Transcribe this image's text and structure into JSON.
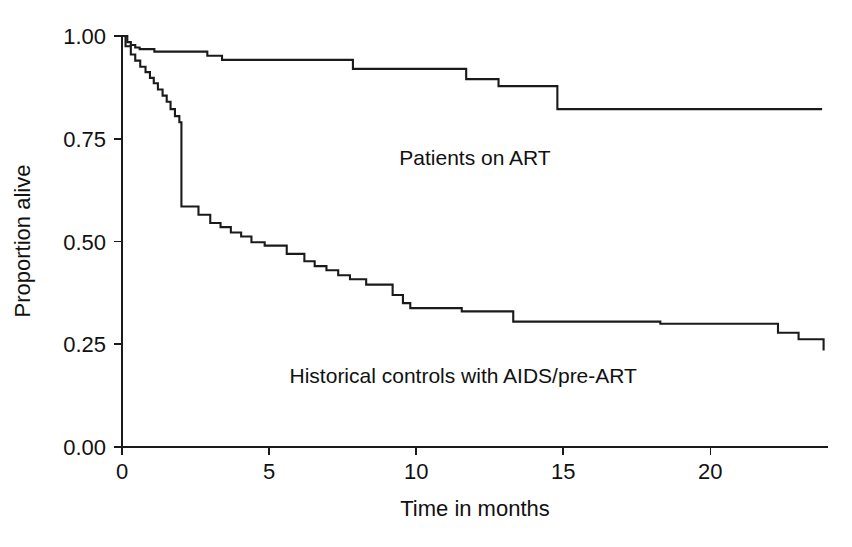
{
  "chart_data": {
    "type": "line",
    "subtype": "kaplan-meier-survival",
    "title": "",
    "xlabel": "Time in months",
    "ylabel": "Proportion alive",
    "xlim": [
      0,
      24
    ],
    "ylim": [
      0,
      1.0
    ],
    "xticks": [
      0,
      5,
      10,
      15,
      20
    ],
    "xtick_labels": [
      "0",
      "5",
      "10",
      "15",
      "20"
    ],
    "yticks": [
      0.0,
      0.25,
      0.5,
      0.75,
      1.0
    ],
    "ytick_labels": [
      "0.00",
      "0.25",
      "0.50",
      "0.75",
      "1.00"
    ],
    "grid": false,
    "legend_position": "inline-annotations",
    "line_color": "#1a1a1a",
    "background_color": "#ffffff",
    "series": [
      {
        "name": "Patients on ART",
        "label": "Patients on ART",
        "label_x": 12.0,
        "label_y": 0.685,
        "step": "post",
        "x": [
          0.0,
          0.18,
          0.3,
          0.45,
          0.6,
          1.1,
          2.9,
          3.4,
          7.85,
          11.7,
          12.8,
          14.8,
          23.8
        ],
        "y": [
          1.0,
          0.985,
          0.978,
          0.972,
          0.968,
          0.962,
          0.952,
          0.942,
          0.92,
          0.895,
          0.878,
          0.822,
          0.822
        ]
      },
      {
        "name": "Historical controls with AIDS/pre-ART",
        "label": "Historical controls with AIDS/pre-ART",
        "label_x": 11.6,
        "label_y": 0.155,
        "step": "post",
        "x": [
          0.0,
          0.12,
          0.3,
          0.45,
          0.62,
          0.8,
          0.95,
          1.08,
          1.22,
          1.38,
          1.52,
          1.65,
          1.8,
          1.95,
          2.02,
          2.6,
          3.0,
          3.35,
          3.7,
          4.05,
          4.4,
          4.85,
          5.6,
          6.2,
          6.55,
          6.95,
          7.35,
          7.75,
          8.3,
          9.2,
          9.55,
          9.8,
          11.55,
          13.3,
          18.3,
          22.3,
          23.0,
          23.85
        ],
        "y": [
          1.0,
          0.975,
          0.955,
          0.94,
          0.925,
          0.912,
          0.898,
          0.885,
          0.87,
          0.855,
          0.84,
          0.822,
          0.805,
          0.79,
          0.585,
          0.565,
          0.545,
          0.535,
          0.522,
          0.512,
          0.498,
          0.49,
          0.47,
          0.452,
          0.44,
          0.43,
          0.418,
          0.408,
          0.395,
          0.37,
          0.35,
          0.338,
          0.33,
          0.305,
          0.3,
          0.278,
          0.262,
          0.235
        ]
      }
    ]
  },
  "plot_geometry": {
    "left": 122,
    "right": 828,
    "top": 36,
    "bottom": 447,
    "tick_length": 8,
    "x_axis_title_x": 475,
    "x_axis_title_y": 516,
    "y_axis_title_x": 30,
    "y_axis_title_y": 241
  }
}
